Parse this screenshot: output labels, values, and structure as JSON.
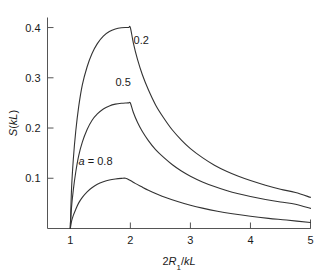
{
  "chart_data": {
    "type": "line",
    "title": "",
    "subtitle": "",
    "xlabel": "2R₁/kL",
    "xlabel_parts": {
      "prefix": "2",
      "italic1": "R",
      "subscript": "1",
      "separator": "/",
      "italic2": "kL"
    },
    "ylabel": "S(kL)",
    "ylabel_parts": {
      "italic1": "S",
      "open": "(",
      "italic2": "kL",
      "close": ")"
    },
    "xlim": [
      0.62,
      5.0
    ],
    "ylim": [
      0.0,
      0.42
    ],
    "xticks": [
      1,
      2,
      3,
      4,
      5
    ],
    "xtick_labels": [
      "1",
      "2",
      "3",
      "4",
      "5"
    ],
    "yticks": [
      0.1,
      0.2,
      0.3,
      0.4
    ],
    "ytick_labels": [
      "0.1",
      "0.2",
      "0.3",
      "0.4"
    ],
    "grid": false,
    "legend_position": "inline-annotations",
    "line_color": "#333333",
    "series": [
      {
        "name": "a = 0.2",
        "label": "0.2",
        "label_x": 2.18,
        "label_y": 0.368,
        "peak_x": 2.0,
        "peak_y": 0.4,
        "end_y": 0.062,
        "x": [
          1.0,
          1.02,
          1.05,
          1.09,
          1.14,
          1.2,
          1.28,
          1.36,
          1.45,
          1.55,
          1.65,
          1.75,
          1.85,
          1.93,
          1.97,
          2.0,
          2.05,
          2.12,
          2.2,
          2.3,
          2.42,
          2.55,
          2.7,
          2.85,
          3.0,
          3.2,
          3.4,
          3.6,
          3.8,
          4.0,
          4.25,
          4.5,
          4.75,
          5.0
        ],
        "y": [
          0.0,
          0.078,
          0.138,
          0.193,
          0.243,
          0.286,
          0.322,
          0.348,
          0.368,
          0.383,
          0.392,
          0.397,
          0.3995,
          0.4,
          0.4,
          0.4,
          0.369,
          0.336,
          0.306,
          0.276,
          0.246,
          0.221,
          0.196,
          0.176,
          0.159,
          0.141,
          0.126,
          0.114,
          0.104,
          0.0955,
          0.0862,
          0.0783,
          0.0716,
          0.062
        ]
      },
      {
        "name": "a = 0.5",
        "label": "0.5",
        "label_x": 1.88,
        "label_y": 0.283,
        "peak_x": 2.0,
        "peak_y": 0.25,
        "end_y": 0.04,
        "x": [
          1.0,
          1.02,
          1.05,
          1.09,
          1.14,
          1.2,
          1.28,
          1.36,
          1.45,
          1.55,
          1.65,
          1.75,
          1.85,
          1.93,
          1.97,
          2.0,
          2.05,
          2.12,
          2.2,
          2.3,
          2.42,
          2.55,
          2.7,
          2.85,
          3.0,
          3.2,
          3.4,
          3.6,
          3.8,
          4.0,
          4.25,
          4.5,
          4.75,
          5.0
        ],
        "y": [
          0.0,
          0.042,
          0.077,
          0.112,
          0.145,
          0.172,
          0.197,
          0.215,
          0.228,
          0.238,
          0.244,
          0.2475,
          0.2493,
          0.2499,
          0.25,
          0.25,
          0.231,
          0.211,
          0.193,
          0.175,
          0.157,
          0.142,
          0.127,
          0.1145,
          0.1042,
          0.0928,
          0.0836,
          0.0758,
          0.0692,
          0.0637,
          0.0578,
          0.0527,
          0.0483,
          0.04
        ]
      },
      {
        "name": "a = 0.8",
        "label": "a = 0.8",
        "label_x": 1.42,
        "label_y": 0.127,
        "peak_x": 1.92,
        "peak_y": 0.1,
        "end_y": 0.012,
        "x": [
          1.0,
          1.02,
          1.05,
          1.09,
          1.14,
          1.2,
          1.28,
          1.36,
          1.45,
          1.55,
          1.65,
          1.75,
          1.85,
          1.92,
          2.0,
          2.08,
          2.18,
          2.3,
          2.45,
          2.6,
          2.8,
          3.0,
          3.2,
          3.45,
          3.7,
          4.0,
          4.3,
          4.6,
          5.0
        ],
        "y": [
          0.0,
          0.014,
          0.026,
          0.038,
          0.051,
          0.062,
          0.073,
          0.081,
          0.088,
          0.093,
          0.0965,
          0.0985,
          0.0997,
          0.1,
          0.0955,
          0.0898,
          0.0835,
          0.0762,
          0.0683,
          0.0613,
          0.0531,
          0.0462,
          0.0405,
          0.0344,
          0.0294,
          0.0243,
          0.0202,
          0.0168,
          0.012
        ]
      }
    ]
  },
  "figure": {
    "background_color": "#ffffff",
    "axis_color": "#555555"
  }
}
